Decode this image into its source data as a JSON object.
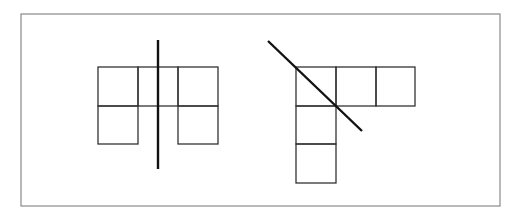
{
  "diagram": {
    "frame": {
      "x": 21,
      "y": 14,
      "width": 479,
      "height": 192,
      "stroke": "#8a8a8a"
    },
    "colors": {
      "square_stroke": "#333333",
      "line_stroke": "#111111",
      "background": "#ffffff"
    },
    "figures": [
      {
        "name": "left-figure",
        "description": "Five unit squares (2x3 grid with bottom-middle removed) with a vertical symmetry line",
        "squares": [
          {
            "x": 98,
            "y": 67,
            "w": 40,
            "h": 39
          },
          {
            "x": 138,
            "y": 67,
            "w": 40,
            "h": 39
          },
          {
            "x": 178,
            "y": 67,
            "w": 40,
            "h": 39
          },
          {
            "x": 98,
            "y": 106,
            "w": 40,
            "h": 38
          },
          {
            "x": 138,
            "y": 106,
            "w": 40,
            "h": 38
          },
          {
            "x": 178,
            "y": 106,
            "w": 40,
            "h": 38
          }
        ],
        "hidden_bottom_middle": true,
        "line": {
          "x1": 158,
          "y1": 40,
          "x2": 158,
          "y2": 169,
          "orientation": "vertical"
        }
      },
      {
        "name": "right-figure",
        "description": "L-shaped arrangement of five unit squares with a diagonal line of symmetry",
        "squares": [
          {
            "x": 296,
            "y": 67,
            "w": 40,
            "h": 39
          },
          {
            "x": 336,
            "y": 67,
            "w": 40,
            "h": 39
          },
          {
            "x": 376,
            "y": 67,
            "w": 39,
            "h": 39
          },
          {
            "x": 296,
            "y": 106,
            "w": 40,
            "h": 38
          },
          {
            "x": 296,
            "y": 144,
            "w": 40,
            "h": 39
          }
        ],
        "line": {
          "x1": 268,
          "y1": 41,
          "x2": 362,
          "y2": 131,
          "orientation": "diagonal"
        }
      }
    ]
  }
}
